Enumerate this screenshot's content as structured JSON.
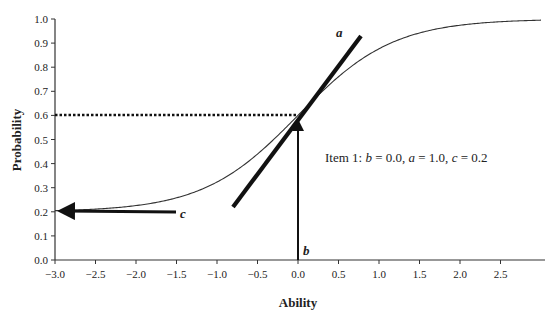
{
  "chart_data": {
    "type": "line",
    "title": "",
    "xlabel": "Ability",
    "ylabel": "Probability",
    "xlim": [
      -3.0,
      3.0
    ],
    "ylim": [
      0.0,
      1.0
    ],
    "grid": false,
    "legend": null,
    "x_ticks": [
      "-3.0",
      "-2.5",
      "-2.0",
      "-1.5",
      "-1.0",
      "-0.5",
      "0.0",
      "0.5",
      "1.0",
      "1.5",
      "2.0",
      "2.5"
    ],
    "y_ticks": [
      "0.0",
      "0.1",
      "0.2",
      "0.3",
      "0.4",
      "0.5",
      "0.6",
      "0.7",
      "0.8",
      "0.9",
      "1.0"
    ],
    "series": [
      {
        "name": "Item 1 ICC (3PL)",
        "model": "P = c + (1 - c) / (1 + exp(-1.7 a (theta - b)))",
        "params": {
          "b": 0.0,
          "a": 1.0,
          "c": 0.2
        },
        "x": [
          -3.0,
          -2.5,
          -2.0,
          -1.5,
          -1.0,
          -0.5,
          0.0,
          0.5,
          1.0,
          1.5,
          2.0,
          2.5,
          3.0
        ],
        "values": [
          0.205,
          0.212,
          0.226,
          0.254,
          0.305,
          0.389,
          0.6,
          0.811,
          0.895,
          0.946,
          0.974,
          0.988,
          0.995
        ]
      }
    ],
    "annotations": [
      {
        "label": "a",
        "type": "tangent-line",
        "description": "slope at inflection point",
        "from": [
          -0.8,
          0.22
        ],
        "to": [
          0.75,
          0.93
        ]
      },
      {
        "label": "b",
        "type": "vertical-arrow",
        "description": "difficulty location",
        "x": 0.0,
        "from_y": 0.0,
        "to_y": 0.6
      },
      {
        "label": "c",
        "type": "horizontal-arrow",
        "description": "lower asymptote",
        "y": 0.2,
        "from_x": -1.5,
        "to_x": -3.0
      },
      {
        "type": "dotted-reference-line",
        "y": 0.6,
        "from_x": -3.0,
        "to_x": 0.0
      },
      {
        "type": "text",
        "text": "Item 1: b = 0.0, a = 1.0, c = 0.2",
        "x": 0.15,
        "y": 0.46
      }
    ]
  },
  "labels": {
    "xlabel": "Ability",
    "ylabel": "Probability",
    "a": "a",
    "b": "b",
    "c": "c",
    "item_prefix": "Item 1: ",
    "b_sym": "b",
    "b_val": " = 0.0, ",
    "a_sym": "a",
    "a_val": " = 1.0, ",
    "c_sym": "c",
    "c_val": " = 0.2"
  }
}
